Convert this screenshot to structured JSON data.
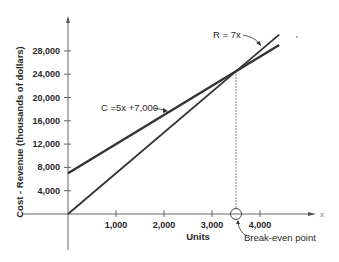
{
  "chart_data": {
    "type": "line",
    "title": "",
    "xlabel": "Units",
    "ylabel": "Cost - Revenue (thousands of dollars)",
    "x_axis_letter": "x",
    "xlim": [
      0,
      5000
    ],
    "ylim": [
      0,
      32000
    ],
    "x_ticks": [
      1000,
      2000,
      3000,
      4000
    ],
    "x_tick_labels": [
      "1,000",
      "2,000",
      "3,000",
      "4,000"
    ],
    "y_ticks": [
      4000,
      8000,
      12000,
      16000,
      20000,
      24000,
      28000
    ],
    "y_tick_labels": [
      "4,000",
      "8,000",
      "12,000",
      "16,000",
      "20,000",
      "24,000",
      "28,000"
    ],
    "grid": false,
    "legend": "none",
    "series": [
      {
        "name": "Cost",
        "label": "C =5x +7,000",
        "equation": "C = 5x + 7000",
        "x": [
          0,
          4400
        ],
        "values": [
          7000,
          29000
        ]
      },
      {
        "name": "Revenue",
        "label": "R = 7x",
        "equation": "R = 7x",
        "x": [
          0,
          4400
        ],
        "values": [
          0,
          30800
        ]
      }
    ],
    "annotations": [
      {
        "text": "C =5x +7,000",
        "target": "Cost"
      },
      {
        "text": "R = 7x",
        "target": "Revenue"
      },
      {
        "text": "Break-even point",
        "x": 3500,
        "y": 24500
      }
    ],
    "break_even": {
      "x": 3500,
      "y": 24500
    },
    "colors": {
      "line": "#333333",
      "axis": "#555555",
      "text": "#2a2a2a"
    }
  }
}
